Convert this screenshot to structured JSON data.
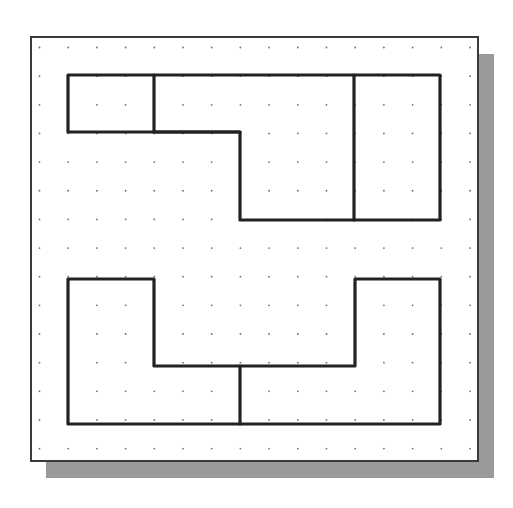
{
  "diagram": {
    "title": "",
    "background": "#ffffff",
    "frame": {
      "x": 31,
      "y": 37,
      "w": 447,
      "h": 424,
      "stroke": "#3a3a3a",
      "stroke_width": 2
    },
    "shadow": {
      "x": 46,
      "y": 54,
      "w": 448,
      "h": 424,
      "color": "#9a9a9a"
    },
    "grid": {
      "origin_x": 39.5,
      "origin_y": 47.5,
      "spacing_x": 28.7,
      "spacing_y": 28.65,
      "cols": 16,
      "rows": 15,
      "dot_color": "#6f6f6f",
      "dot_r": 0.9
    },
    "line_color": "#222222",
    "line_width": 3.2,
    "views": [
      {
        "name": "top-view",
        "outline": [
          [
            68,
            75
          ],
          [
            440,
            75
          ],
          [
            440,
            220
          ],
          [
            240,
            220
          ],
          [
            240,
            132
          ],
          [
            68,
            132
          ]
        ],
        "internal_lines": [
          [
            [
              154,
              75
            ],
            [
              154,
              132
            ]
          ],
          [
            [
              354,
              75
            ],
            [
              354,
              220
            ]
          ],
          [
            [
              154,
              132
            ],
            [
              240,
              132
            ]
          ]
        ]
      },
      {
        "name": "front-view",
        "outline": [
          [
            68,
            279
          ],
          [
            154,
            279
          ],
          [
            154,
            366
          ],
          [
            355,
            366
          ],
          [
            355,
            279
          ],
          [
            440,
            279
          ],
          [
            440,
            424
          ],
          [
            68,
            424
          ]
        ],
        "internal_lines": [
          [
            [
              240,
              366
            ],
            [
              240,
              424
            ]
          ]
        ]
      }
    ]
  }
}
